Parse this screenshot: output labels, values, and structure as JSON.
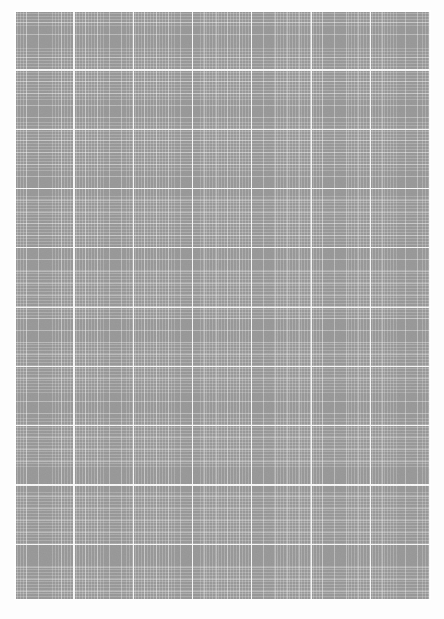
{
  "page": {
    "kind": "grid-sheet",
    "title": "",
    "width_px": 444,
    "height_px": 619,
    "has_text": false,
    "has_controls": false
  },
  "colors": {
    "page_background": "#fdfdfd",
    "grid_fill": "#9b9b9b",
    "major_line": "#ffffff",
    "mid_line": "#d4d4d4",
    "minor_line": "#b4b4b4",
    "border_line": "#ffffff"
  },
  "grid": {
    "field_left_px": 14,
    "field_top_px": 10,
    "field_width_px": 417,
    "field_height_px": 590,
    "major_spacing_px": 59.3,
    "mid_spacing_px": 11.86,
    "minor_spacing_px": 2.96,
    "major_columns": 7,
    "major_rows": 10
  },
  "labels": {
    "field_description": "Blank gray grid field with white major and minor gridlines",
    "margin_description": "White page margin surrounding the grid field"
  }
}
